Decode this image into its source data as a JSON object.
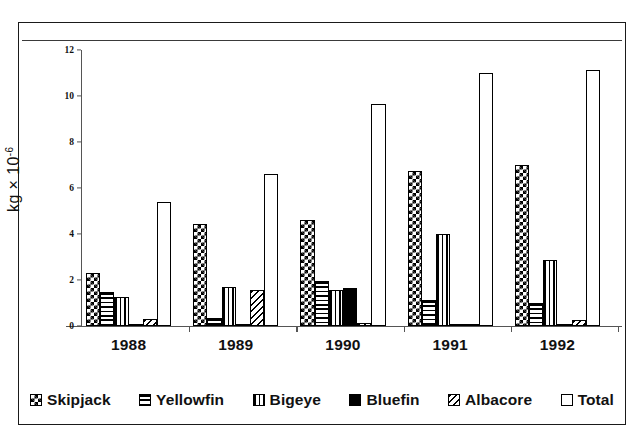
{
  "chart_data": {
    "type": "bar",
    "title": "",
    "xlabel": "",
    "ylabel": "kg × 10⁻⁶",
    "ylabel_base": "kg × 10",
    "ylabel_exp": "-6",
    "ylim": [
      0,
      12
    ],
    "ytick_values": [
      0,
      2,
      4,
      6,
      8,
      10,
      12
    ],
    "ytick_labels": [
      "0",
      "2",
      "4",
      "6",
      "8",
      "10",
      "12"
    ],
    "grid": false,
    "legend_position": "bottom",
    "categories": [
      "1988",
      "1989",
      "1990",
      "1991",
      "1992"
    ],
    "series": [
      {
        "name": "Skipjack",
        "pattern": "checker",
        "values": [
          2.3,
          4.45,
          4.6,
          6.75,
          7.0
        ]
      },
      {
        "name": "Yellowfin",
        "pattern": "hlines",
        "values": [
          1.5,
          0.35,
          1.95,
          1.15,
          1.0
        ]
      },
      {
        "name": "Bigeye",
        "pattern": "vlines",
        "values": [
          1.25,
          1.7,
          1.55,
          4.0,
          2.85
        ]
      },
      {
        "name": "Bluefin",
        "pattern": "solid",
        "values": [
          0.05,
          0.08,
          1.65,
          0.05,
          0.02
        ]
      },
      {
        "name": "Albacore",
        "pattern": "diag",
        "values": [
          0.3,
          1.55,
          0.15,
          0.1,
          0.25
        ]
      },
      {
        "name": "Total",
        "pattern": "empty",
        "values": [
          5.4,
          6.6,
          9.65,
          11.0,
          11.15
        ]
      }
    ]
  },
  "legend": {
    "items": [
      {
        "label": "Skipjack",
        "pattern": "checker"
      },
      {
        "label": "Yellowfin",
        "pattern": "hlines"
      },
      {
        "label": "Bigeye",
        "pattern": "vlines"
      },
      {
        "label": "Bluefin",
        "pattern": "solid"
      },
      {
        "label": "Albacore",
        "pattern": "diag"
      },
      {
        "label": "Total",
        "pattern": "empty"
      }
    ]
  }
}
